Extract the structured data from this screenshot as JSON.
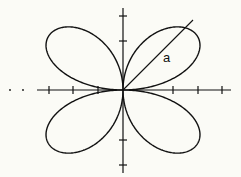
{
  "diagram": {
    "curve": "r = a sin 2θ",
    "radius_label": "a",
    "colors": {
      "background": "#fbfbf6",
      "stroke": "#111111"
    },
    "axes": {
      "x_ticks": 6,
      "y_ticks": 4,
      "x_leading_dots": 2
    }
  }
}
